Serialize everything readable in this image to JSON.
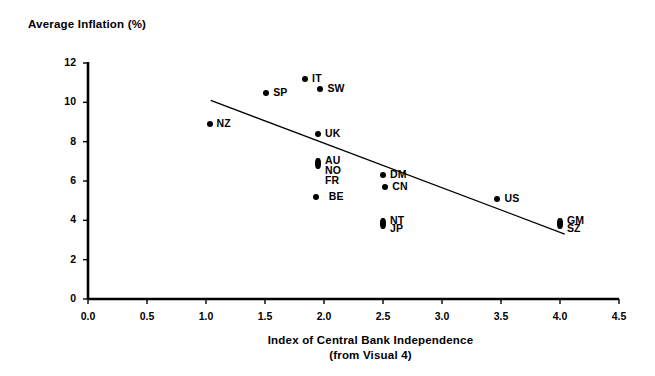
{
  "chart_data": {
    "type": "scatter",
    "title": "",
    "ylabel": "Average Inflation (%)",
    "xlabel": "Index of Central Bank Independence",
    "xlabel_line2": "(from Visual 4)",
    "xlim": [
      0.0,
      4.5
    ],
    "ylim": [
      0,
      12
    ],
    "xticks": [
      "0.0",
      "0.5",
      "1.0",
      "1.5",
      "2.0",
      "2.5",
      "3.0",
      "3.5",
      "4.0",
      "4.5"
    ],
    "xtick_values": [
      0.0,
      0.5,
      1.0,
      1.5,
      2.0,
      2.5,
      3.0,
      3.5,
      4.0,
      4.5
    ],
    "yticks": [
      "0",
      "2",
      "4",
      "6",
      "8",
      "10",
      "12"
    ],
    "ytick_values": [
      0,
      2,
      4,
      6,
      8,
      10,
      12
    ],
    "grid": false,
    "legend": false,
    "marker_color": "#000000",
    "axis_color": "#000000",
    "trendline": {
      "label": "regression-line",
      "x0": 1.04,
      "y0": 10.1,
      "x1": 4.04,
      "y1": 3.3,
      "color": "#000000"
    },
    "points": [
      {
        "label": "NZ",
        "x": 1.03,
        "y": 8.9,
        "label_pos": "right"
      },
      {
        "label": "SP",
        "x": 1.51,
        "y": 10.5,
        "label_pos": "right"
      },
      {
        "label": "IT",
        "x": 1.84,
        "y": 11.2,
        "label_pos": "right"
      },
      {
        "label": "SW",
        "x": 1.97,
        "y": 10.7,
        "label_pos": "right"
      },
      {
        "label": "UK",
        "x": 1.95,
        "y": 8.4,
        "label_pos": "right"
      },
      {
        "label": "AU",
        "x": 1.95,
        "y": 7.0,
        "label_pos": "right"
      },
      {
        "label": "NO",
        "x": 1.95,
        "y": 6.5,
        "label_pos": "right"
      },
      {
        "label": "FR",
        "x": 1.95,
        "y": 6.0,
        "label_pos": "right"
      },
      {
        "label": "BE",
        "x": 1.93,
        "y": 5.2,
        "label_pos": "right-gap"
      },
      {
        "label": "DM",
        "x": 2.5,
        "y": 6.3,
        "label_pos": "right"
      },
      {
        "label": "CN",
        "x": 2.52,
        "y": 5.7,
        "label_pos": "right"
      },
      {
        "label": "NT",
        "x": 2.5,
        "y": 3.95,
        "label_pos": "right"
      },
      {
        "label": "JP",
        "x": 2.5,
        "y": 3.55,
        "label_pos": "right"
      },
      {
        "label": "US",
        "x": 3.47,
        "y": 5.1,
        "label_pos": "right"
      },
      {
        "label": "GM",
        "x": 4.0,
        "y": 3.95,
        "label_pos": "right"
      },
      {
        "label": "SZ",
        "x": 4.0,
        "y": 3.55,
        "label_pos": "right"
      }
    ]
  }
}
